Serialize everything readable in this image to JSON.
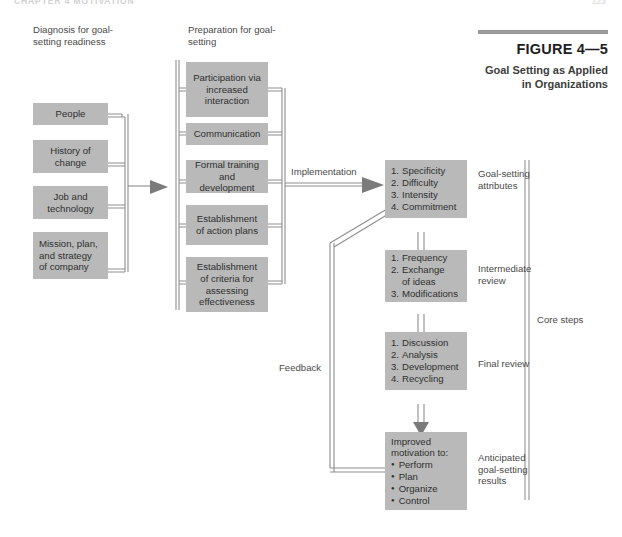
{
  "page": {
    "running_head": "CHAPTER 4  MOTIVATION",
    "folio": "123"
  },
  "figure": {
    "number": "FIGURE 4—5",
    "title": "Goal Setting as Applied in Organizations"
  },
  "headings": {
    "left": "Diagnosis for goal-setting readiness",
    "middle": "Preparation for goal-setting"
  },
  "diagnosis_boxes": [
    {
      "label": "People"
    },
    {
      "label": "History of change"
    },
    {
      "label": "Job and technology"
    },
    {
      "label": "Mission, plan, and strategy of company"
    }
  ],
  "preparation_boxes": [
    {
      "label": "Participation via increased interaction"
    },
    {
      "label": "Communication"
    },
    {
      "label": "Formal training and development"
    },
    {
      "label": "Establishment of action plans"
    },
    {
      "label": "Establishment of criteria for assessing effectiveness"
    }
  ],
  "core_steps": [
    {
      "side_label": "Goal-setting attributes",
      "items": [
        "Specificity",
        "Difficulty",
        "Intensity",
        "Commitment"
      ],
      "list_type": "numbered"
    },
    {
      "side_label": "Intermediate review",
      "items": [
        "Frequency",
        "Exchange of ideas",
        "Modifications"
      ],
      "list_type": "numbered"
    },
    {
      "side_label": "Final review",
      "items": [
        "Discussion",
        "Analysis",
        "Development",
        "Recycling"
      ],
      "list_type": "numbered"
    },
    {
      "side_label": "Anticipated goal-setting results",
      "heading": "Improved motivation to:",
      "items": [
        "Perform",
        "Plan",
        "Organize",
        "Control"
      ],
      "list_type": "bulleted"
    }
  ],
  "flow_labels": {
    "implementation": "Implementation",
    "feedback": "Feedback",
    "core_steps": "Core steps"
  },
  "colors": {
    "box_fill": "#b9b9b9",
    "line": "#8d8d8d",
    "text": "#3a3a3a",
    "rule": "#9a9a9a"
  }
}
